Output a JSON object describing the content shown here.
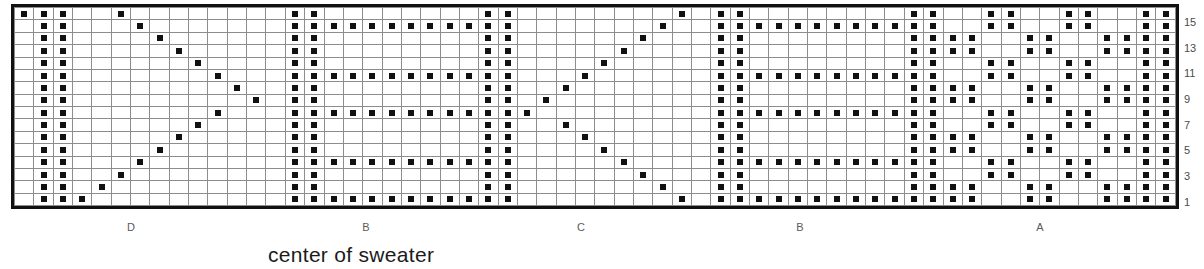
{
  "chart_data": {
    "type": "table",
    "title": "center of sweater",
    "columns": 60,
    "rows": 16,
    "row_labels": [
      "1",
      "",
      "3",
      "",
      "5",
      "",
      "7",
      "",
      "9",
      "",
      "11",
      "",
      "13",
      "",
      "15",
      ""
    ],
    "row_label_order": "bottom-to-top",
    "section_letters": [
      {
        "label": "D",
        "x": 131
      },
      {
        "label": "B",
        "x": 366
      },
      {
        "label": "C",
        "x": 581
      },
      {
        "label": "B",
        "x": 800
      },
      {
        "label": "A",
        "x": 1040
      }
    ],
    "caption": "center of sweater",
    "legend": {
      "filled": "marked stitch",
      "empty": "background stitch"
    },
    "colors": {
      "filled": "#111111",
      "grid_line": "#8d8d8d",
      "border": "#111111",
      "background": "#ffffff"
    },
    "grid": [
      "110100000000000000110101010101010100000001001100000011001100110011",
      "110010000000000000110000000000000000000010001100000011001100110011",
      "110001000000000000111111111111100000100001101100110011001111001111",
      "110000100000000000110000000000001000000001101100110011001111001111",
      "110000010000000000110000000000000100000001001100000011001100110011",
      "110000001000000000110000000000000010000001001100000011001100110011",
      "110000000100000000111111111111000001000001101100110011001111001111",
      "110000000010000000110000000000000000100001101100110011001111001111",
      "110000000100000000110000000000000010000001001100000011001100110011",
      "110000001000000000110000000000000100000001001100000011001100110011",
      "110000010000000000111111111111001000000001101100110011001111001111",
      "110000100000000000110000000000010000000001101100110011001111001111",
      "110001000000000000110000000000100000000001001100000011001100110011",
      "110010000000000000110000000001000000000001001100000011001100110011",
      "110100000000000000111111111110000000000001101100110011001111001111",
      "111000000000000000110000000100000000000001101100110011001111001111"
    ],
    "grid_note": "Each string is one row, bottom row first; '1' = filled stitch, '0' = empty. Strings are truncated placeholders and the real pattern is generated in script from the motif definitions below.",
    "motifs": {
      "left_chevron": {
        "start_col": 3,
        "peak_col": 12,
        "peak_row": 9,
        "description": "single-stitch diagonal zigzag forming a V / chevron"
      },
      "vertical_bars": {
        "columns": [
          1,
          2,
          14,
          15,
          24,
          25,
          36,
          37,
          46,
          47,
          58,
          59
        ],
        "description": "solid vertical stitch columns"
      },
      "horizontal_dashes": {
        "rows": [
          1,
          4,
          8,
          11,
          15
        ],
        "description": "solid horizontal stitch rows between bars"
      },
      "right_checker": {
        "start_col": 48,
        "block": 2,
        "description": "two-by-two checkerboard block pattern"
      }
    }
  }
}
